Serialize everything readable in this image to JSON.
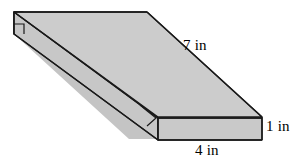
{
  "figure": {
    "kind": "rectangular-prism-isometric",
    "background_color": "#ffffff",
    "face_fill_color": "#c8c8c8",
    "top_face_fill_color": "#cdcdcd",
    "front_face_fill_color": "#c9c9c9",
    "side_face_fill_color": "#c2c2c2",
    "outline_color": "#1a1a1a",
    "outline_width": 1.4,
    "label_color": "#000000",
    "labels": {
      "length": "7 in",
      "height": "1 in",
      "width": "4 in"
    },
    "right_angle_markers": 2,
    "geometry": {
      "top_face_points": "14,12 147,12 262,117 129,117",
      "front_face_points": "158,118 262,118 262,140 158,140",
      "left_face_points": "14,12 14,34 129,139 129,117",
      "note": "oblique projection, depth direction runs down-right"
    }
  }
}
